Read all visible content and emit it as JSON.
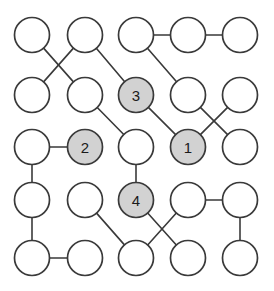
{
  "figure": {
    "name": "node-graph-diagram",
    "type": "graph",
    "width": 274,
    "height": 291,
    "background_color": "#ffffff"
  },
  "style": {
    "node_radius": 17.5,
    "node_fill_plain": "#ffffff",
    "node_fill_marked": "#d2d2d2",
    "node_stroke": "#3a3a3a",
    "edge_stroke": "#3a3a3a",
    "edge_width": 1.6,
    "label_color": "#1a1a1a",
    "label_font_size": 15
  },
  "graph_data": {
    "type": "graph",
    "layout": "grid",
    "grid": {
      "columns": 5,
      "rows": 5,
      "column_x": [
        32,
        85,
        136,
        188,
        240
      ],
      "row_y": [
        35,
        95,
        147,
        200,
        258
      ]
    },
    "nodes": [
      {
        "id": "r0c0",
        "col": 0,
        "row": 0,
        "cx": 32,
        "cy": 35,
        "label": "",
        "marked": false
      },
      {
        "id": "r0c1",
        "col": 1,
        "row": 0,
        "cx": 85,
        "cy": 35,
        "label": "",
        "marked": false
      },
      {
        "id": "r0c2",
        "col": 2,
        "row": 0,
        "cx": 136,
        "cy": 35,
        "label": "",
        "marked": false
      },
      {
        "id": "r0c3",
        "col": 3,
        "row": 0,
        "cx": 188,
        "cy": 35,
        "label": "",
        "marked": false
      },
      {
        "id": "r0c4",
        "col": 4,
        "row": 0,
        "cx": 240,
        "cy": 35,
        "label": "",
        "marked": false
      },
      {
        "id": "r1c0",
        "col": 0,
        "row": 1,
        "cx": 32,
        "cy": 95,
        "label": "",
        "marked": false
      },
      {
        "id": "r1c1",
        "col": 1,
        "row": 1,
        "cx": 85,
        "cy": 95,
        "label": "",
        "marked": false
      },
      {
        "id": "r1c2",
        "col": 2,
        "row": 1,
        "cx": 136,
        "cy": 95,
        "label": "3",
        "marked": true
      },
      {
        "id": "r1c3",
        "col": 3,
        "row": 1,
        "cx": 188,
        "cy": 95,
        "label": "",
        "marked": false
      },
      {
        "id": "r1c4",
        "col": 4,
        "row": 1,
        "cx": 240,
        "cy": 95,
        "label": "",
        "marked": false
      },
      {
        "id": "r2c0",
        "col": 0,
        "row": 2,
        "cx": 32,
        "cy": 147,
        "label": "",
        "marked": false
      },
      {
        "id": "r2c1",
        "col": 1,
        "row": 2,
        "cx": 85,
        "cy": 147,
        "label": "2",
        "marked": true
      },
      {
        "id": "r2c2",
        "col": 2,
        "row": 2,
        "cx": 136,
        "cy": 147,
        "label": "",
        "marked": false
      },
      {
        "id": "r2c3",
        "col": 3,
        "row": 2,
        "cx": 188,
        "cy": 147,
        "label": "1",
        "marked": true
      },
      {
        "id": "r2c4",
        "col": 4,
        "row": 2,
        "cx": 240,
        "cy": 147,
        "label": "",
        "marked": false
      },
      {
        "id": "r3c0",
        "col": 0,
        "row": 3,
        "cx": 32,
        "cy": 200,
        "label": "",
        "marked": false
      },
      {
        "id": "r3c1",
        "col": 1,
        "row": 3,
        "cx": 85,
        "cy": 200,
        "label": "",
        "marked": false
      },
      {
        "id": "r3c2",
        "col": 2,
        "row": 3,
        "cx": 136,
        "cy": 200,
        "label": "4",
        "marked": true
      },
      {
        "id": "r3c3",
        "col": 3,
        "row": 3,
        "cx": 188,
        "cy": 200,
        "label": "",
        "marked": false
      },
      {
        "id": "r3c4",
        "col": 4,
        "row": 3,
        "cx": 240,
        "cy": 200,
        "label": "",
        "marked": false
      },
      {
        "id": "r4c0",
        "col": 0,
        "row": 4,
        "cx": 32,
        "cy": 258,
        "label": "",
        "marked": false
      },
      {
        "id": "r4c1",
        "col": 1,
        "row": 4,
        "cx": 85,
        "cy": 258,
        "label": "",
        "marked": false
      },
      {
        "id": "r4c2",
        "col": 2,
        "row": 4,
        "cx": 136,
        "cy": 258,
        "label": "",
        "marked": false
      },
      {
        "id": "r4c3",
        "col": 3,
        "row": 4,
        "cx": 188,
        "cy": 258,
        "label": "",
        "marked": false
      },
      {
        "id": "r4c4",
        "col": 4,
        "row": 4,
        "cx": 240,
        "cy": 258,
        "label": "",
        "marked": false
      }
    ],
    "edges": [
      {
        "source": "r0c0",
        "target": "r1c1"
      },
      {
        "source": "r0c1",
        "target": "r1c0"
      },
      {
        "source": "r0c1",
        "target": "r1c2"
      },
      {
        "source": "r0c2",
        "target": "r0c3"
      },
      {
        "source": "r0c3",
        "target": "r0c4"
      },
      {
        "source": "r0c2",
        "target": "r1c3"
      },
      {
        "source": "r1c1",
        "target": "r2c2"
      },
      {
        "source": "r1c2",
        "target": "r2c3"
      },
      {
        "source": "r1c3",
        "target": "r2c4"
      },
      {
        "source": "r1c4",
        "target": "r2c3"
      },
      {
        "source": "r2c0",
        "target": "r2c1"
      },
      {
        "source": "r2c0",
        "target": "r3c0"
      },
      {
        "source": "r2c2",
        "target": "r3c2"
      },
      {
        "source": "r3c0",
        "target": "r4c0"
      },
      {
        "source": "r4c0",
        "target": "r4c1"
      },
      {
        "source": "r3c1",
        "target": "r4c2"
      },
      {
        "source": "r3c2",
        "target": "r4c3"
      },
      {
        "source": "r3c3",
        "target": "r4c2"
      },
      {
        "source": "r3c3",
        "target": "r3c4"
      },
      {
        "source": "r3c4",
        "target": "r4c4"
      }
    ],
    "marked_nodes": [
      {
        "label": "1",
        "node": "r2c3"
      },
      {
        "label": "2",
        "node": "r2c1"
      },
      {
        "label": "3",
        "node": "r1c2"
      },
      {
        "label": "4",
        "node": "r3c2"
      }
    ]
  }
}
